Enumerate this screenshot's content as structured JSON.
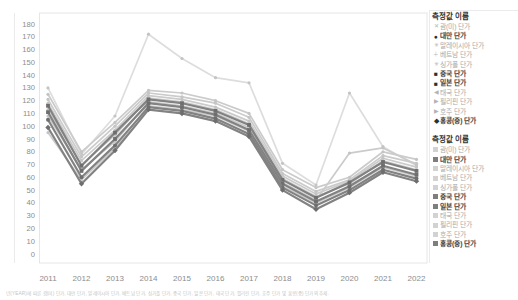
{
  "page": {
    "caption": "년(YEAR)에 따른 괌(미) 단가, 대만 단가, 말레이시아 단가, 베트남 단가, 싱가폴 단가, 중국 단가, 일본 단가, 태국 단가, 필리핀 단가, 호주 단가 및 홍콩(중) 단가의 추세."
  },
  "colors": {
    "line_light": "#cbcbcb",
    "line_lighter": "#dddddd",
    "line_dark": "#828282",
    "marker_dark": "#6e6e6e",
    "marker_light": "#c4c4c4",
    "axis_text": "#8c8c8c",
    "plot_border": "#e6e6e6",
    "swatch_light": "#d2d2d2",
    "swatch_dark": "#7e7e7e"
  },
  "legends": {
    "shape_legend": {
      "title": "측정값 이름",
      "items": [
        {
          "label": "괌(미) 단가",
          "marker": "x",
          "highlighted": false
        },
        {
          "label": "대만 단가",
          "marker": "circle",
          "highlighted": true
        },
        {
          "label": "말레이시아 단가",
          "marker": "asterisk",
          "highlighted": false
        },
        {
          "label": "베트남 단가",
          "marker": "plus",
          "highlighted": false
        },
        {
          "label": "싱가폴 단가",
          "marker": "asterisk",
          "highlighted": false
        },
        {
          "label": "중국 단가",
          "marker": "square",
          "highlighted": true
        },
        {
          "label": "일본 단가",
          "marker": "square",
          "highlighted": true
        },
        {
          "label": "태국 단가",
          "marker": "triangle-left",
          "highlighted": false
        },
        {
          "label": "필리핀 단가",
          "marker": "triangle-right",
          "highlighted": false
        },
        {
          "label": "호주 단가",
          "marker": "triangle-right",
          "highlighted": false
        },
        {
          "label": "홍콩(중) 단가",
          "marker": "diamond",
          "highlighted": true
        }
      ]
    },
    "color_legend": {
      "title": "측정값 이름",
      "items": [
        {
          "label": "괌(미) 단가",
          "highlighted": false
        },
        {
          "label": "대만 단가",
          "highlighted": true
        },
        {
          "label": "말레이시아 단가",
          "highlighted": false
        },
        {
          "label": "베트남 단가",
          "highlighted": false
        },
        {
          "label": "싱가폴 단가",
          "highlighted": false
        },
        {
          "label": "중국 단가",
          "highlighted": true
        },
        {
          "label": "일본 단가",
          "highlighted": true
        },
        {
          "label": "태국 단가",
          "highlighted": false
        },
        {
          "label": "필리핀 단가",
          "highlighted": false
        },
        {
          "label": "호주 단가",
          "highlighted": false
        },
        {
          "label": "홍콩(중) 단가",
          "highlighted": true
        }
      ]
    }
  },
  "chart_data": {
    "type": "line",
    "x": [
      2011,
      2012,
      2013,
      2014,
      2015,
      2016,
      2017,
      2018,
      2019,
      2020,
      2021,
      2022
    ],
    "xlabel": "",
    "ylabel": "",
    "ylim": [
      0,
      180
    ],
    "ytick_step": 10,
    "grid": false,
    "legend_position": "right",
    "series": [
      {
        "name": "괌(미) 단가",
        "highlighted": false,
        "shade": "lighter",
        "marker": "x",
        "values": [
          130,
          78,
          108,
          172,
          153,
          138,
          134,
          71,
          54,
          126,
          84,
          69
        ]
      },
      {
        "name": "말레이시아 단가",
        "highlighted": false,
        "shade": "light",
        "marker": "asterisk",
        "values": [
          125,
          80,
          103,
          128,
          126,
          120,
          110,
          66,
          52,
          60,
          80,
          74
        ]
      },
      {
        "name": "베트남 단가",
        "highlighted": false,
        "shade": "light",
        "marker": "plus",
        "values": [
          121,
          76,
          100,
          126,
          123,
          118,
          107,
          63,
          49,
          58,
          77,
          71
        ]
      },
      {
        "name": "싱가폴 단가",
        "highlighted": false,
        "shade": "light",
        "marker": "asterisk",
        "values": [
          118,
          73,
          97,
          124,
          121,
          115,
          104,
          61,
          47,
          57,
          75,
          68
        ]
      },
      {
        "name": "태국 단가",
        "highlighted": false,
        "shade": "light",
        "marker": "triangle-left",
        "values": [
          113,
          70,
          93,
          122,
          119,
          113,
          102,
          59,
          45,
          55,
          73,
          66
        ]
      },
      {
        "name": "필리핀 단가",
        "highlighted": false,
        "shade": "light",
        "marker": "triangle-right",
        "values": [
          108,
          66,
          88,
          119,
          116,
          110,
          99,
          56,
          42,
          79,
          83,
          70
        ]
      },
      {
        "name": "호주 단가",
        "highlighted": false,
        "shade": "light",
        "marker": "triangle-right",
        "values": [
          95,
          58,
          83,
          116,
          113,
          108,
          96,
          53,
          40,
          52,
          68,
          61
        ]
      },
      {
        "name": "중국 단가",
        "highlighted": true,
        "shade": "dark",
        "marker": "square",
        "values": [
          116,
          69,
          95,
          121,
          118,
          112,
          101,
          58,
          44,
          56,
          72,
          65
        ]
      },
      {
        "name": "일본 단가",
        "highlighted": true,
        "shade": "dark",
        "marker": "square",
        "values": [
          111,
          65,
          90,
          118,
          115,
          109,
          97,
          55,
          41,
          53,
          69,
          62
        ]
      },
      {
        "name": "대만 단가",
        "highlighted": true,
        "shade": "dark",
        "marker": "circle",
        "values": [
          105,
          60,
          85,
          115,
          112,
          106,
          94,
          52,
          38,
          50,
          66,
          59
        ]
      },
      {
        "name": "홍콩(중) 단가",
        "highlighted": true,
        "shade": "dark",
        "marker": "diamond",
        "values": [
          99,
          55,
          81,
          113,
          110,
          104,
          92,
          50,
          35,
          48,
          64,
          57
        ]
      }
    ]
  }
}
